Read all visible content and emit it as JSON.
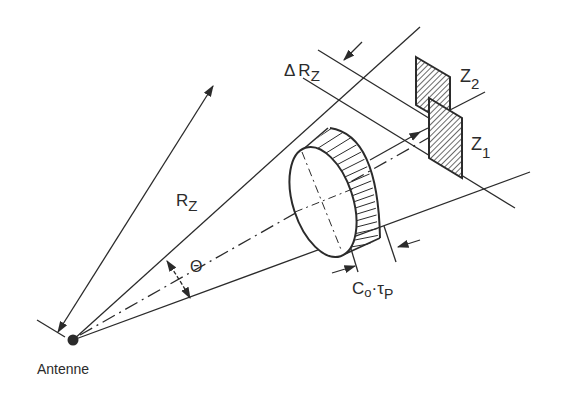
{
  "diagram": {
    "colors": {
      "ink": "#2b2b2b",
      "background": "#ffffff"
    },
    "labels": {
      "antenna": "Antenne",
      "range_symbol": "R",
      "range_sub": "Z",
      "delta_range_delta": "Δ",
      "delta_range_symbol": "R",
      "delta_range_sub": "Z",
      "beam_angle": "Θ",
      "pulse_c": "C",
      "pulse_c_sub": "o",
      "pulse_dot": "·",
      "pulse_tau": "τ",
      "pulse_tau_sub": "P",
      "target2": "Z",
      "target2_sub": "2",
      "target1": "Z",
      "target1_sub": "1"
    }
  }
}
